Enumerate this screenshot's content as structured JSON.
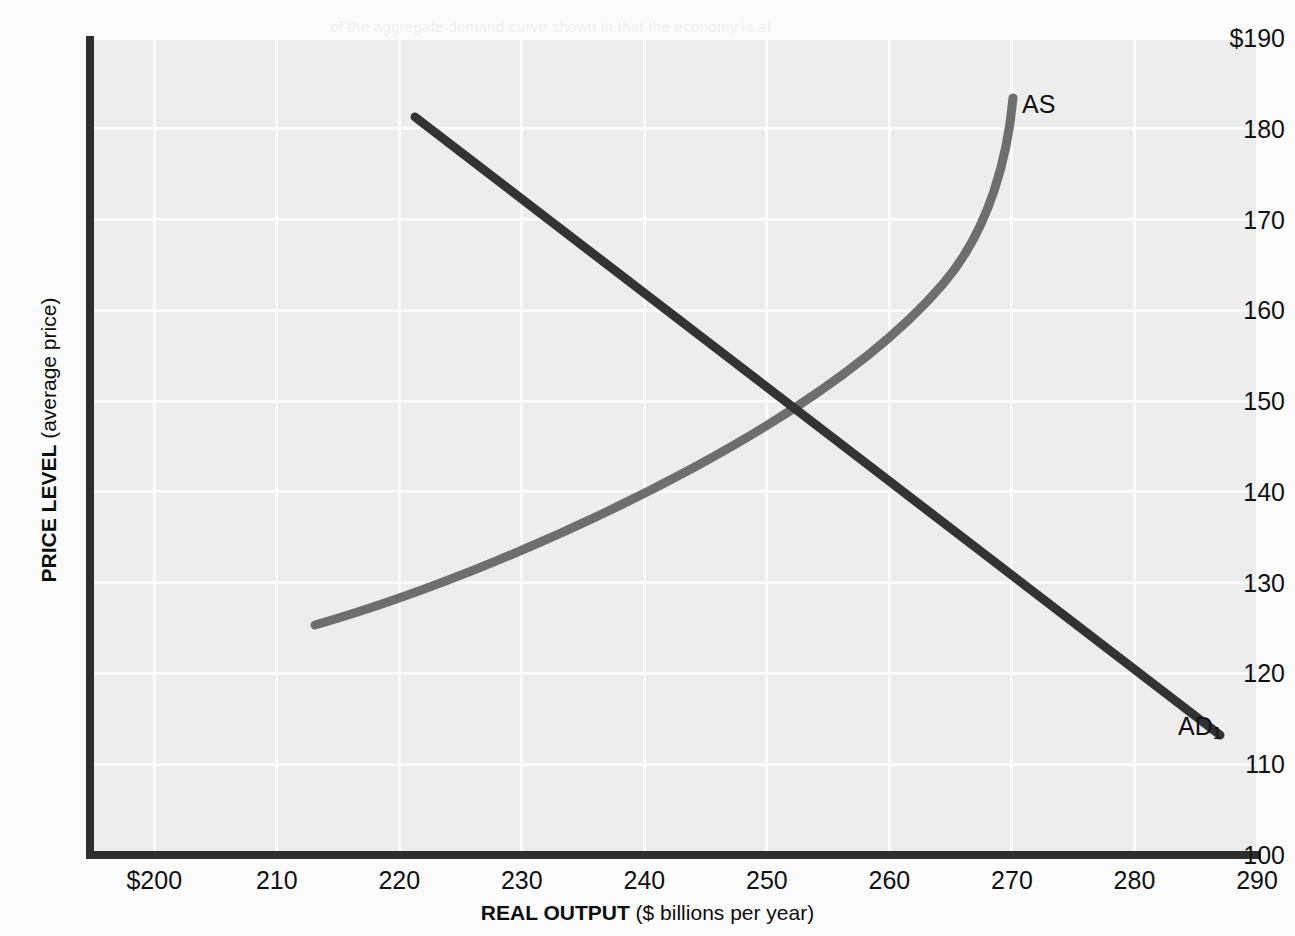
{
  "figure": {
    "background_color": "#fbfbfb",
    "plot_background_color": "#ededed",
    "gridline_color": "#fafafa",
    "axis_color": "#2e2e2e"
  },
  "axes": {
    "y": {
      "title_bold": "PRICE LEVEL",
      "title_regular": " (average price)",
      "ticks": [
        "$190",
        "180",
        "170",
        "160",
        "150",
        "140",
        "130",
        "120",
        "110",
        "100"
      ],
      "tick_values": [
        190,
        180,
        170,
        160,
        150,
        140,
        130,
        120,
        110,
        100
      ],
      "min": 100,
      "max": 190
    },
    "x": {
      "title_bold": "REAL OUTPUT",
      "title_regular": " ($ billions per year)",
      "ticks": [
        "$200",
        "210",
        "220",
        "230",
        "240",
        "250",
        "260",
        "270",
        "280",
        "290"
      ],
      "tick_values": [
        200,
        210,
        220,
        230,
        240,
        250,
        260,
        270,
        280,
        290
      ],
      "min": 195,
      "max": 290
    }
  },
  "curves": {
    "as": {
      "label": "AS",
      "color": "#6e6e6e",
      "label_x": 1022,
      "label_y": 90
    },
    "ad": {
      "label": "AD",
      "label_subscript": "1",
      "color": "#333333",
      "label_x": 1178,
      "label_y": 712
    }
  },
  "equilibrium": {
    "output": 250,
    "price_level": 150
  },
  "ghost_text": [
    {
      "top": 6,
      "left": 330,
      "text": "of the aggregate demand curve shown in that the economy is at"
    },
    {
      "top": 50,
      "left": 420,
      "text": "at equilibrium"
    },
    {
      "top": 94,
      "left": 130,
      "text": "economic conditions where the price level of $150 is the equilibrium in 2015"
    },
    {
      "top": 122,
      "left": 200,
      "text": "at this point the quantity of real output demanded equals the quantity"
    },
    {
      "top": 160,
      "left": 430,
      "text": "total spending in the economy. People in the market"
    },
    {
      "top": 188,
      "left": 250,
      "text": "the level of output are less than the level of output being produced"
    },
    {
      "top": 270,
      "left": 180,
      "text": "When the economy is in equilibrium at point E, the level of real output"
    },
    {
      "top": 298,
      "left": 150,
      "text": "thus economists and policy makers focus much attention on the nature of the equi"
    },
    {
      "top": 338,
      "left": 120,
      "text": "$150 and real GDP of $250 billion makes that particular price level stable at $250 billion"
    },
    {
      "top": 368,
      "left": 200,
      "text": "equilibrium is the focus of macro policy. Consider the need to look at aggregate demand"
    },
    {
      "top": 448,
      "left": 110,
      "text": "The sections in Figure 1 shows how the shifts in the AD curve influence the level of equi"
    },
    {
      "top": 528,
      "left": 120,
      "text": "Figure 1 AS-AD curve model of the macro economy aggregate supply and aggregate demand in the AS-AD model"
    }
  ]
}
